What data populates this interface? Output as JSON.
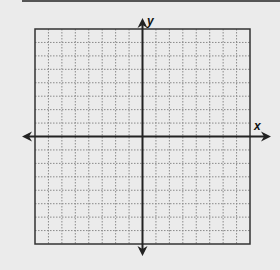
{
  "diagram": {
    "type": "coordinate-plane",
    "grid_squares_x": 16,
    "grid_squares_y": 16,
    "x_axis_label": "x",
    "y_axis_label": "y",
    "colors": {
      "background": "#ebebeb",
      "axis": "#222222",
      "grid": "#8a8a8a",
      "frame": "#333333"
    }
  }
}
